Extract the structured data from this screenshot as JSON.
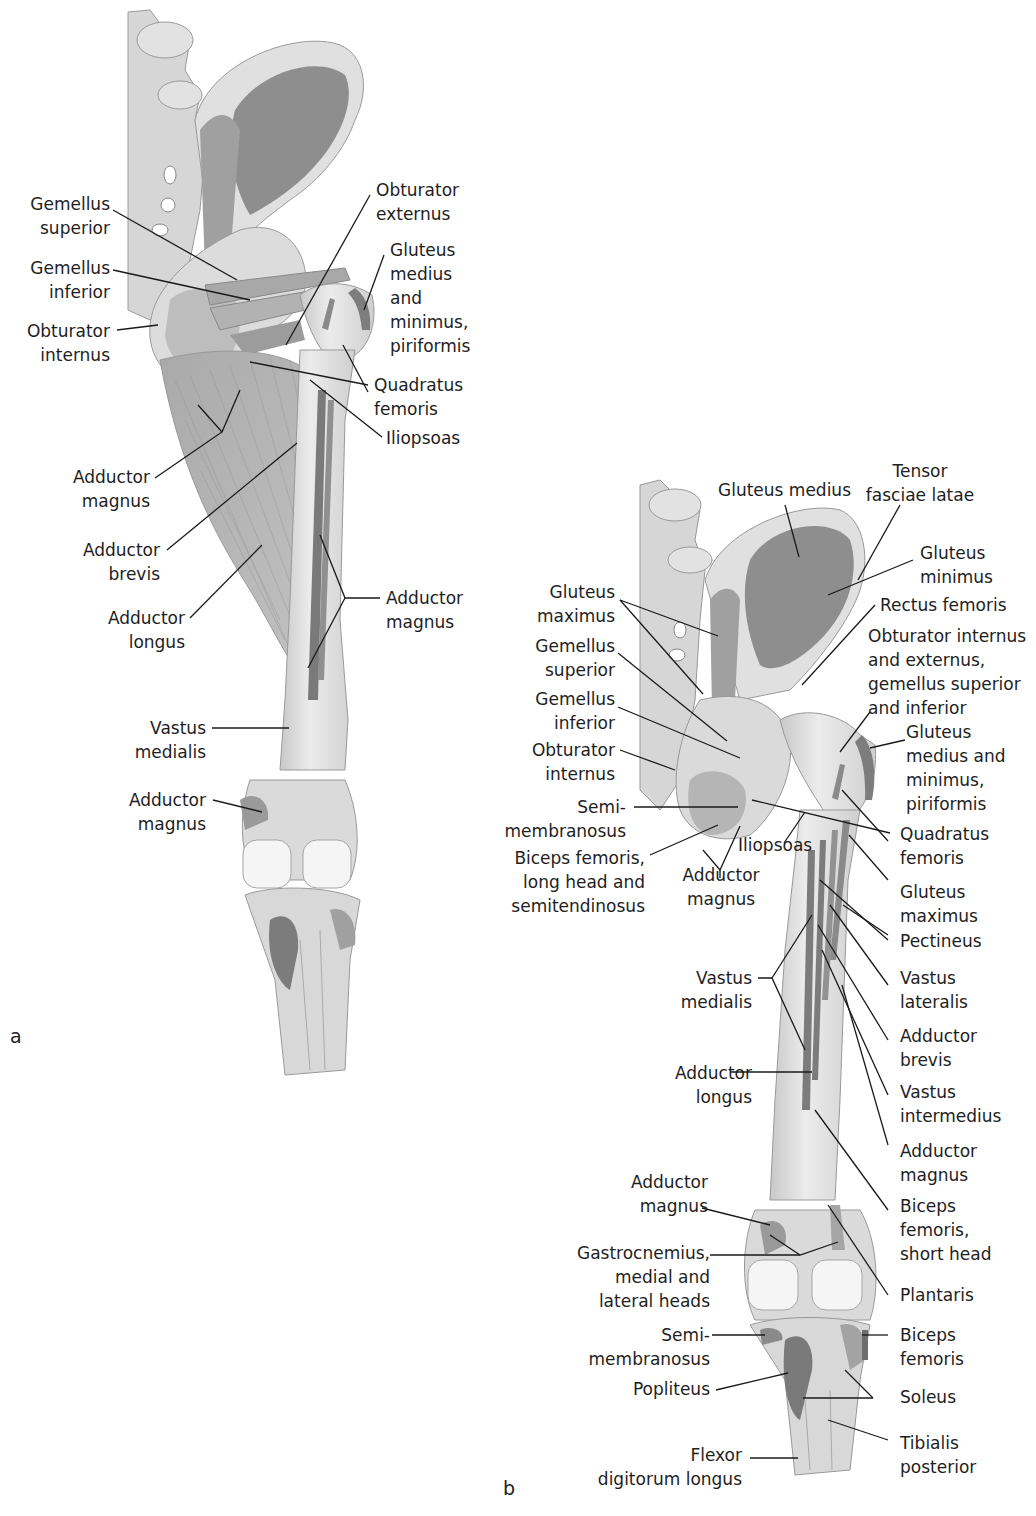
{
  "figure": {
    "panels": [
      {
        "letter": "a",
        "labels": [
          {
            "id": "gemellus-superior",
            "lines": [
              "Gemellus",
              "superior"
            ]
          },
          {
            "id": "gemellus-inferior",
            "lines": [
              "Gemellus",
              "inferior"
            ]
          },
          {
            "id": "obturator-internus",
            "lines": [
              "Obturator",
              "internus"
            ]
          },
          {
            "id": "obturator-externus",
            "lines": [
              "Obturator",
              "externus"
            ]
          },
          {
            "id": "gluteus-medius-minimus-piriformis",
            "lines": [
              "Gluteus",
              "medius",
              "and",
              "minimus,",
              "piriformis"
            ]
          },
          {
            "id": "quadratus-femoris",
            "lines": [
              "Quadratus",
              "femoris"
            ]
          },
          {
            "id": "iliopsoas",
            "lines": [
              "Iliopsoas"
            ]
          },
          {
            "id": "adductor-magnus-upper",
            "lines": [
              "Adductor",
              "magnus"
            ]
          },
          {
            "id": "adductor-brevis",
            "lines": [
              "Adductor",
              "brevis"
            ]
          },
          {
            "id": "adductor-longus",
            "lines": [
              "Adductor",
              "longus"
            ]
          },
          {
            "id": "adductor-magnus-right",
            "lines": [
              "Adductor",
              "magnus"
            ]
          },
          {
            "id": "vastus-medialis",
            "lines": [
              "Vastus",
              "medialis"
            ]
          },
          {
            "id": "adductor-magnus-lower",
            "lines": [
              "Adductor",
              "magnus"
            ]
          }
        ]
      },
      {
        "letter": "b",
        "labels": [
          {
            "id": "gluteus-medius",
            "lines": [
              "Gluteus medius"
            ]
          },
          {
            "id": "tensor-fasciae-latae",
            "lines": [
              "Tensor",
              "fasciae latae"
            ]
          },
          {
            "id": "gluteus-minimus",
            "lines": [
              "Gluteus",
              "minimus"
            ]
          },
          {
            "id": "rectus-femoris",
            "lines": [
              "Rectus femoris"
            ]
          },
          {
            "id": "obturator-int-ext-gemelli",
            "lines": [
              "Obturator internus",
              "and externus,",
              "gemellus superior",
              "and inferior"
            ]
          },
          {
            "id": "gluteus-medius-minimus-piriformis",
            "lines": [
              "Gluteus",
              "medius and",
              "minimus,",
              "piriformis"
            ]
          },
          {
            "id": "quadratus-femoris",
            "lines": [
              "Quadratus",
              "femoris"
            ]
          },
          {
            "id": "gluteus-maximus-left",
            "lines": [
              "Gluteus",
              "maximus"
            ]
          },
          {
            "id": "gemellus-superior",
            "lines": [
              "Gemellus",
              "superior"
            ]
          },
          {
            "id": "gemellus-inferior",
            "lines": [
              "Gemellus",
              "inferior"
            ]
          },
          {
            "id": "obturator-internus",
            "lines": [
              "Obturator",
              "internus"
            ]
          },
          {
            "id": "semimembranosus-upper",
            "lines": [
              "Semi-",
              "membranosus"
            ]
          },
          {
            "id": "biceps-femoris-long-semitendinosus",
            "lines": [
              "Biceps femoris,",
              "long head and",
              "semitendinosus"
            ]
          },
          {
            "id": "iliopsoas",
            "lines": [
              "Iliopsoas"
            ]
          },
          {
            "id": "adductor-magnus-upper",
            "lines": [
              "Adductor",
              "magnus"
            ]
          },
          {
            "id": "gluteus-maximus-right",
            "lines": [
              "Gluteus",
              "maximus"
            ]
          },
          {
            "id": "pectineus",
            "lines": [
              "Pectineus"
            ]
          },
          {
            "id": "vastus-lateralis",
            "lines": [
              "Vastus",
              "lateralis"
            ]
          },
          {
            "id": "adductor-brevis",
            "lines": [
              "Adductor",
              "brevis"
            ]
          },
          {
            "id": "vastus-intermedius",
            "lines": [
              "Vastus",
              "intermedius"
            ]
          },
          {
            "id": "adductor-magnus-right",
            "lines": [
              "Adductor",
              "magnus"
            ]
          },
          {
            "id": "biceps-femoris-short-head",
            "lines": [
              "Biceps",
              "femoris,",
              "short head"
            ]
          },
          {
            "id": "vastus-medialis",
            "lines": [
              "Vastus",
              "medialis"
            ]
          },
          {
            "id": "adductor-longus",
            "lines": [
              "Adductor",
              "longus"
            ]
          },
          {
            "id": "adductor-magnus-lower",
            "lines": [
              "Adductor",
              "magnus"
            ]
          },
          {
            "id": "gastrocnemius",
            "lines": [
              "Gastrocnemius,",
              "medial and",
              "lateral heads"
            ]
          },
          {
            "id": "plantaris",
            "lines": [
              "Plantaris"
            ]
          },
          {
            "id": "semimembranosus-lower",
            "lines": [
              "Semi-",
              "membranosus"
            ]
          },
          {
            "id": "biceps-femoris",
            "lines": [
              "Biceps",
              "femoris"
            ]
          },
          {
            "id": "popliteus",
            "lines": [
              "Popliteus"
            ]
          },
          {
            "id": "soleus",
            "lines": [
              "Soleus"
            ]
          },
          {
            "id": "tibialis-posterior",
            "lines": [
              "Tibialis",
              "posterior"
            ]
          },
          {
            "id": "flexor-digitorum-longus",
            "lines": [
              "Flexor",
              "digitorum longus"
            ]
          }
        ]
      }
    ]
  },
  "colors": {
    "background": "#ffffff",
    "bone": "#e4e4e4",
    "bone_shade": "#c9c9c9",
    "muscle_attachment": "#8f8f8f",
    "muscle": "#b5b5b5",
    "leader_line": "#1a1a1a",
    "text": "#1e1e1e"
  }
}
